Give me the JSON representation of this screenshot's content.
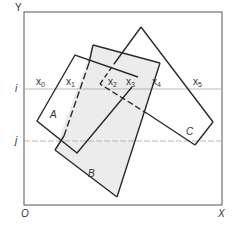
{
  "diagram": {
    "axes": {
      "y_label": "Y",
      "x_label": "X",
      "origin_label": "O"
    },
    "scanlines": [
      {
        "label": "i",
        "y": 89
      },
      {
        "label": "j",
        "y": 141
      }
    ],
    "intersections": [
      {
        "base": "x",
        "sub": "0",
        "x": 36,
        "y": 79
      },
      {
        "base": "x",
        "sub": "1",
        "x": 66,
        "y": 79
      },
      {
        "base": "x",
        "sub": "2",
        "x": 107,
        "y": 79
      },
      {
        "base": "x",
        "sub": "3",
        "x": 125,
        "y": 79
      },
      {
        "base": "x",
        "sub": "4",
        "x": 150,
        "y": 79
      },
      {
        "base": "x",
        "sub": "5",
        "x": 191,
        "y": 79
      }
    ],
    "polygons": [
      {
        "label": "A",
        "label_x": 50,
        "label_y": 111
      },
      {
        "label": "B",
        "label_x": 88,
        "label_y": 170
      },
      {
        "label": "C",
        "label_x": 186,
        "label_y": 128
      }
    ],
    "colors": {
      "stroke": "#2a2a2a",
      "fill": "#ececec",
      "scanline": "#aaaaaa",
      "frame": "#555555"
    }
  }
}
